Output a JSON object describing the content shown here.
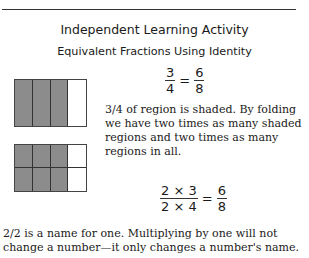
{
  "header": {
    "title": "Independent Learning Activity",
    "subtitle": "Equivalent Fractions Using Identity"
  },
  "figures": {
    "top_region": {
      "columns": 4,
      "rows": 1,
      "shaded_columns": 3,
      "fill_color": "#8c8c8c"
    },
    "bottom_region": {
      "columns": 4,
      "rows": 2,
      "shaded_columns": 3,
      "fill_color": "#8c8c8c"
    }
  },
  "equation1": {
    "left": {
      "num": "3",
      "den": "4"
    },
    "eq": "=",
    "right": {
      "num": "6",
      "den": "8"
    }
  },
  "explanation": "3/4 of region is shaded. By folding we have two times as many shaded regions and two times as many regions in all.",
  "equation2": {
    "a": {
      "num": "2",
      "den": "2"
    },
    "times_num": "×",
    "times_den": "×",
    "b": {
      "num": "3",
      "den": "4"
    },
    "eq": "=",
    "result": {
      "num": "6",
      "den": "8"
    }
  },
  "conclusion": "2/2 is a name for one. Multiplying by one will not change a number—it only changes a number's name."
}
